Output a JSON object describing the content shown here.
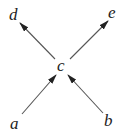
{
  "diagram": {
    "type": "directed-graph",
    "nodes": [
      {
        "id": "a",
        "label": "a",
        "x": 15,
        "y": 127
      },
      {
        "id": "b",
        "label": "b",
        "x": 108,
        "y": 125
      },
      {
        "id": "c",
        "label": "c",
        "x": 60,
        "y": 71
      },
      {
        "id": "d",
        "label": "d",
        "x": 10,
        "y": 19
      },
      {
        "id": "e",
        "label": "e",
        "x": 109,
        "y": 18
      }
    ],
    "edges": [
      {
        "from": "a",
        "to": "c"
      },
      {
        "from": "b",
        "to": "c"
      },
      {
        "from": "c",
        "to": "d"
      },
      {
        "from": "c",
        "to": "e"
      }
    ],
    "colors": {
      "edge": "#555555",
      "label": "#222222"
    }
  }
}
